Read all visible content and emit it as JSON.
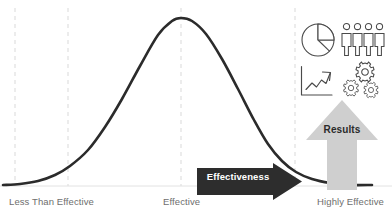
{
  "chart_data": {
    "type": "line",
    "title": "",
    "xlabel": "Effectiveness",
    "ylabel": "",
    "curve_name": "Normal distribution (bell curve)",
    "x_tick_labels": [
      "Less Than Effective",
      "Effective",
      "Highly Effective"
    ],
    "x_tick_positions": [
      0,
      0.5,
      1
    ],
    "gridlines": {
      "visible": true,
      "style": "dashed",
      "color": "#d9d9d9",
      "x_positions": [
        15,
        68,
        181,
        295
      ]
    },
    "axis_baseline": {
      "visible": true,
      "color": "#e2e2e2",
      "y": 186
    },
    "curve": {
      "color": "#2b2b2b",
      "line_width": 2.6,
      "peak_x": 181,
      "peak_y": 18,
      "baseline_y": 185,
      "start_x": 3,
      "end_x": 372,
      "points": [
        [
          3,
          185
        ],
        [
          20,
          184
        ],
        [
          38,
          181
        ],
        [
          55,
          175
        ],
        [
          70,
          166
        ],
        [
          88,
          150
        ],
        [
          105,
          127
        ],
        [
          122,
          99
        ],
        [
          140,
          66
        ],
        [
          158,
          35
        ],
        [
          172,
          21
        ],
        [
          181,
          18
        ],
        [
          192,
          21
        ],
        [
          206,
          34
        ],
        [
          222,
          59
        ],
        [
          238,
          89
        ],
        [
          254,
          120
        ],
        [
          268,
          144
        ],
        [
          282,
          161
        ],
        [
          296,
          172
        ],
        [
          312,
          179
        ],
        [
          330,
          183
        ],
        [
          350,
          185
        ],
        [
          372,
          185
        ]
      ]
    }
  },
  "axis": {
    "low_label": "Less Than Effective",
    "mid_label": "Effective",
    "high_label": "Highly Effective",
    "label_color": "#6e6e6e"
  },
  "effectiveness_banner": {
    "label": "Effectiveness",
    "fill_color": "#2d2d2d",
    "text_color": "#ffffff",
    "direction": "right"
  },
  "results_arrow": {
    "label": "Results",
    "fill_color": "#cfcfcf",
    "text_color": "#2b2b2b",
    "direction": "up"
  },
  "icons": [
    {
      "name": "pie-chart-icon",
      "label": "Pie chart"
    },
    {
      "name": "people-group-icon",
      "label": "Group of four people"
    },
    {
      "name": "trend-up-chart-icon",
      "label": "Upward trend line chart"
    },
    {
      "name": "gears-icon",
      "label": "Three gears"
    }
  ],
  "colors": {
    "curve": "#2b2b2b",
    "gridline": "#d9d9d9",
    "icon_stroke": "#4a4a4a",
    "banner_dark": "#2d2d2d",
    "arrow_gray": "#cfcfcf",
    "label_gray": "#6e6e6e",
    "background": "#ffffff"
  }
}
